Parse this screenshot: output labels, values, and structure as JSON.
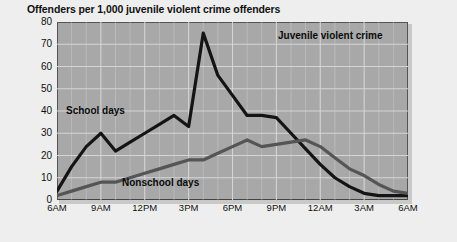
{
  "figure": {
    "title": "Offenders per 1,000 juvenile violent crime offenders",
    "background_color": "#eeeeee",
    "plot_background_color": "#a8a8a8",
    "gridline_color": "#d8d8d8",
    "frame_color": "#555555"
  },
  "annotations": {
    "chart_label": "Juvenile violent crime",
    "school_label": "School days",
    "nonschool_label": "Nonschool days"
  },
  "chart_data": {
    "type": "line",
    "title": "Offenders per 1,000 juvenile violent crime offenders",
    "xlabel": "",
    "ylabel": "",
    "ylim": [
      0,
      80
    ],
    "yticks": [
      0,
      10,
      20,
      30,
      40,
      50,
      60,
      70,
      80
    ],
    "ytick_labels": [
      "0",
      "10",
      "20",
      "30",
      "40",
      "50",
      "60",
      "70",
      "80"
    ],
    "xlim": [
      6,
      30
    ],
    "xticks": [
      6,
      9,
      12,
      15,
      18,
      21,
      24,
      27,
      30
    ],
    "xtick_labels": [
      "6AM",
      "9AM",
      "12PM",
      "3PM",
      "6PM",
      "9PM",
      "12AM",
      "3AM",
      "6AM"
    ],
    "grid": true,
    "legend_position": "inline-annotations",
    "x": [
      6,
      7,
      8,
      9,
      10,
      11,
      12,
      13,
      14,
      15,
      16,
      17,
      18,
      19,
      20,
      21,
      22,
      23,
      24,
      25,
      26,
      27,
      28,
      29,
      30
    ],
    "series": [
      {
        "name": "School days",
        "color": "#141414",
        "line_width": 3.2,
        "values": [
          4,
          15,
          24,
          30,
          22,
          26,
          30,
          34,
          38,
          33,
          75,
          56,
          47,
          38,
          38,
          37,
          30,
          23,
          16,
          10,
          6,
          3,
          2,
          2,
          2
        ]
      },
      {
        "name": "Nonschool days",
        "color": "#555555",
        "line_width": 3.2,
        "values": [
          2,
          4,
          6,
          8,
          8,
          10,
          12,
          14,
          16,
          18,
          18,
          21,
          24,
          27,
          24,
          25,
          26,
          27,
          24,
          19,
          14,
          11,
          7,
          4,
          3
        ]
      }
    ]
  }
}
